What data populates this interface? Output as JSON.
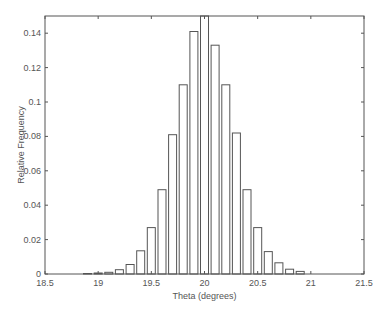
{
  "chart_data": {
    "type": "bar",
    "title": "",
    "xlabel": "Theta (degrees)",
    "ylabel": "Relative Frequency",
    "xlim": [
      18.5,
      21.5
    ],
    "ylim": [
      0,
      0.15
    ],
    "xticks": [
      18.5,
      19,
      19.5,
      20,
      20.5,
      21,
      21.5
    ],
    "xtick_labels": [
      "18.5",
      "19",
      "19.5",
      "20",
      "20.5",
      "21",
      "21.5"
    ],
    "yticks": [
      0,
      0.02,
      0.04,
      0.06,
      0.08,
      0.1,
      0.12,
      0.14
    ],
    "ytick_labels": [
      "0",
      "0.02",
      "0.04",
      "0.06",
      "0.08",
      "0.1",
      "0.12",
      "0.14"
    ],
    "grid": false,
    "legend": null,
    "bar_width": 0.075,
    "x": [
      18.9,
      19.0,
      19.1,
      19.2,
      19.3,
      19.4,
      19.5,
      19.6,
      19.7,
      19.8,
      19.9,
      20.0,
      20.1,
      20.2,
      20.3,
      20.4,
      20.5,
      20.6,
      20.7,
      20.8,
      20.9
    ],
    "values": [
      0.0003,
      0.0006,
      0.001,
      0.0025,
      0.0055,
      0.0135,
      0.027,
      0.049,
      0.081,
      0.11,
      0.141,
      0.155,
      0.133,
      0.11,
      0.082,
      0.049,
      0.027,
      0.013,
      0.0065,
      0.0028,
      0.0015
    ]
  }
}
